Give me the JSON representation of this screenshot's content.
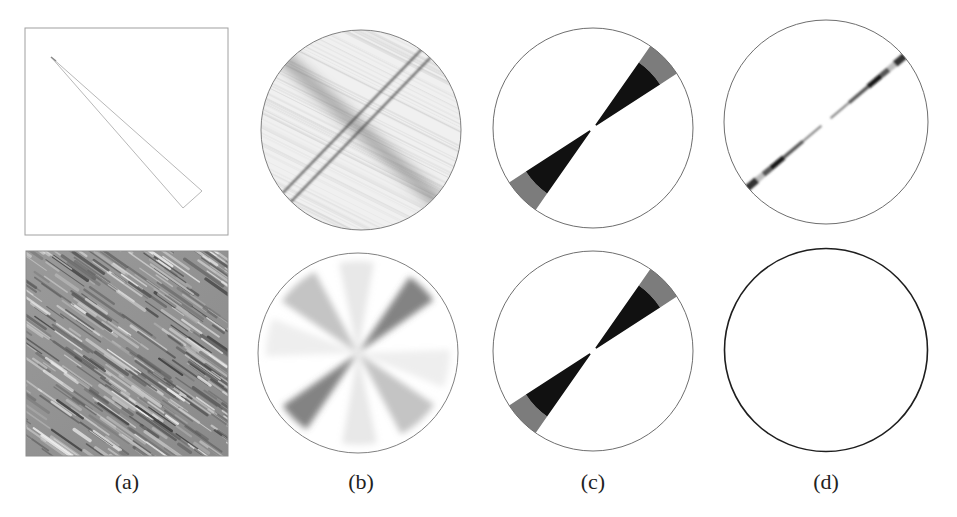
{
  "figure": {
    "columns": [
      {
        "id": "a",
        "label": "(a)",
        "center_x": 127
      },
      {
        "id": "b",
        "label": "(b)",
        "center_x": 361
      },
      {
        "id": "c",
        "label": "(c)",
        "center_x": 593
      },
      {
        "id": "d",
        "label": "(d)",
        "center_x": 826
      }
    ],
    "panels": {
      "a_top": {
        "type": "square-frame",
        "content": "thin wedge outline",
        "frame": [
          25,
          28,
          203,
          207
        ]
      },
      "a_bottom": {
        "type": "texture",
        "content": "oriented diagonal streak texture",
        "frame": [
          26,
          251,
          202,
          205
        ]
      },
      "b_top": {
        "type": "circle",
        "content": "spectrum with broad band and two thin crossing lines",
        "center": [
          361,
          130
        ],
        "r": 100
      },
      "b_bottom": {
        "type": "circle",
        "content": "multiple soft gray angular wedges",
        "center": [
          358,
          353
        ],
        "r": 100
      },
      "c_top": {
        "type": "circle",
        "content": "black double wedge with gray outer band",
        "center": [
          593,
          128
        ],
        "r": 100
      },
      "c_bottom": {
        "type": "circle",
        "content": "black double wedge with gray outer band",
        "center": [
          593,
          351
        ],
        "r": 100
      },
      "d_top": {
        "type": "circle",
        "content": "narrow segmented diagonal line",
        "center": [
          826,
          122
        ],
        "r": 102
      },
      "d_bottom": {
        "type": "circle",
        "content": "empty circle",
        "center": [
          826,
          350
        ],
        "r": 102
      }
    },
    "colors": {
      "frame": "#9a9a9a",
      "circle_outline": "#777777",
      "circle_outline_dark": "#222222",
      "wedge_black": "#111111",
      "wedge_gray": "#7a7a7a"
    }
  }
}
